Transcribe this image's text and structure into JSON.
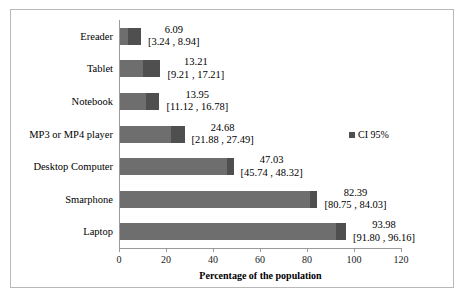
{
  "chart_data": {
    "type": "bar",
    "orientation": "horizontal",
    "title": "",
    "xlabel": "Percentage of the population",
    "ylabel": "",
    "xlim": [
      0,
      120
    ],
    "xticks": [
      0,
      20,
      40,
      60,
      80,
      100,
      120
    ],
    "grid": false,
    "legend": {
      "position": "right",
      "entries": [
        {
          "label": "CI 95%",
          "marker": "square",
          "color": "#4f4f4f"
        }
      ]
    },
    "series_name": "Percentage of the population",
    "bar_color": "#6e6e6e",
    "ci_color": "#4f4f4f",
    "categories": [
      "Ereader",
      "Tablet",
      "Notebook",
      "MP3 or MP4 player",
      "Desktop Computer",
      "Smarphone",
      "Laptop"
    ],
    "values": [
      6.09,
      13.21,
      13.95,
      24.68,
      47.03,
      82.39,
      93.98
    ],
    "ci_lower": [
      3.24,
      9.21,
      11.12,
      21.88,
      45.74,
      80.75,
      91.8
    ],
    "ci_upper": [
      8.94,
      17.21,
      16.78,
      27.49,
      48.32,
      84.03,
      96.16
    ],
    "points": [
      {
        "category": "Ereader",
        "value": 6.09,
        "value_text": "6.09",
        "ci_text": "[3.24 , 8.94]",
        "ci_lower": 3.24,
        "ci_upper": 8.94
      },
      {
        "category": "Tablet",
        "value": 13.21,
        "value_text": "13.21",
        "ci_text": "[9.21 , 17.21]",
        "ci_lower": 9.21,
        "ci_upper": 17.21
      },
      {
        "category": "Notebook",
        "value": 13.95,
        "value_text": "13.95",
        "ci_text": "[11.12 , 16.78]",
        "ci_lower": 11.12,
        "ci_upper": 16.78
      },
      {
        "category": "MP3 or MP4 player",
        "value": 24.68,
        "value_text": "24.68",
        "ci_text": "[21.88 , 27.49]",
        "ci_lower": 21.88,
        "ci_upper": 27.49
      },
      {
        "category": "Desktop Computer",
        "value": 47.03,
        "value_text": "47.03",
        "ci_text": "[45.74 , 48.32]",
        "ci_lower": 45.74,
        "ci_upper": 48.32
      },
      {
        "category": "Smarphone",
        "value": 82.39,
        "value_text": "82.39",
        "ci_text": "[80.75 , 84.03]",
        "ci_lower": 80.75,
        "ci_upper": 84.03
      },
      {
        "category": "Laptop",
        "value": 93.98,
        "value_text": "93.98",
        "ci_text": "[91.80 , 96.16]",
        "ci_lower": 91.8,
        "ci_upper": 96.16
      }
    ],
    "xtick_labels": [
      "0",
      "20",
      "40",
      "60",
      "80",
      "100",
      "120"
    ]
  }
}
